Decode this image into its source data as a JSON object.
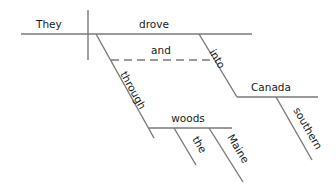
{
  "diagram": {
    "type": "sentence-diagram (Reed-Kellogg)",
    "sentence": "They drove through the Maine woods and into southern Canada",
    "subject": "They",
    "verb": "drove",
    "conjunction": "and",
    "prepositions": [
      "through",
      "into"
    ],
    "objects": {
      "through": {
        "word": "woods",
        "modifiers": [
          "the",
          "Maine"
        ]
      },
      "into": {
        "word": "Canada",
        "modifiers": [
          "southern"
        ]
      }
    },
    "line_color": "#7a7a7a",
    "text_color": "#1a1a1a"
  },
  "labels": {
    "subject": "They",
    "verb": "drove",
    "conjunction": "and",
    "prep1": "through",
    "prep2": "into",
    "obj1": "woods",
    "obj2": "Canada",
    "mod_the": "the",
    "mod_maine": "Maine",
    "mod_southern": "southern"
  }
}
